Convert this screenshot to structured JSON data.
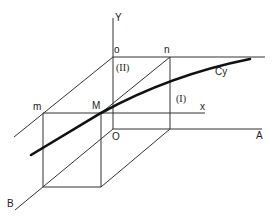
{
  "figure": {
    "type": "3D coordinate diagram with curve",
    "labels": {
      "y_axis": "Y",
      "x_axis": "x",
      "point_o": "o",
      "point_n": "n",
      "point_m": "m",
      "point_M": "M",
      "origin": "O",
      "axis_A": "A",
      "axis_B": "B",
      "curve": "Cy",
      "region_1": "(I)",
      "region_2": "(II)"
    },
    "colors": {
      "line": "#333333",
      "curve": "#111111",
      "background": "#ffffff"
    }
  }
}
